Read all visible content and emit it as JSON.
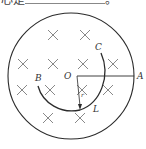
{
  "question": {
    "text_prefix": "心是",
    "text_suffix": "。"
  },
  "diagram": {
    "labels": {
      "O": "O",
      "A": "A",
      "B": "B",
      "C": "C",
      "L": "L",
      "r": "r"
    },
    "field_symbol": "×",
    "field_marks": [
      [
        53,
        35
      ],
      [
        85,
        35
      ],
      [
        23,
        64
      ],
      [
        53,
        64
      ],
      [
        83,
        64
      ],
      [
        113,
        64
      ],
      [
        22,
        90
      ],
      [
        50,
        90
      ],
      [
        82,
        90
      ],
      [
        108,
        90
      ],
      [
        48,
        118
      ],
      [
        80,
        118
      ]
    ],
    "colors": {
      "stroke": "#2b2b2b",
      "marks": "#777777"
    }
  }
}
